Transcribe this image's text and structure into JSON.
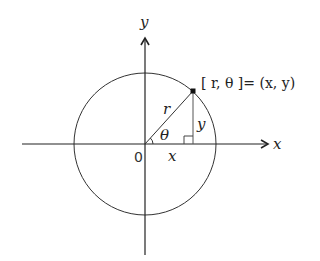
{
  "diagram": {
    "labels": {
      "x_axis": "x",
      "y_axis": "y",
      "origin": "0",
      "radius": "r",
      "angle": "θ",
      "x_leg": "x",
      "y_leg": "y",
      "point": "[ r,  θ ]= (x, y)"
    },
    "colors": {
      "stroke": "#222222",
      "background": "#ffffff"
    }
  }
}
